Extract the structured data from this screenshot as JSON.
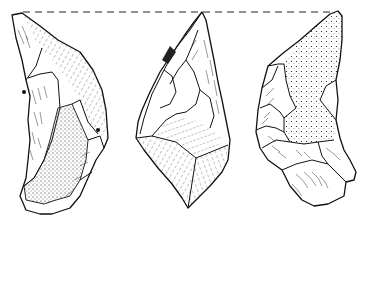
{
  "figure": {
    "type": "archaeological line drawing",
    "background_color": "#ffffff",
    "line_color": "#111111",
    "reference_line": {
      "style": "dashed",
      "y": 12,
      "x_start": 23,
      "x_end": 335
    },
    "views": [
      {
        "id": "left",
        "label": "",
        "shading": "cortex stipple on lower central face, hatched flake scars on upper face"
      },
      {
        "id": "middle",
        "label": "",
        "shading": "hatched flake scars throughout"
      },
      {
        "id": "right",
        "label": "",
        "shading": "dense cortex stipple on upper body, hatched flake scars at base"
      }
    ]
  }
}
